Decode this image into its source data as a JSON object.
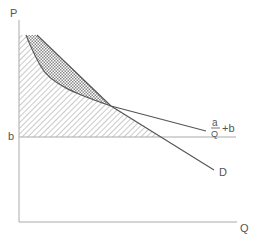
{
  "diagram": {
    "type": "economics-demand-curve",
    "axes": {
      "y_label": "P",
      "x_label": "Q"
    },
    "levels": {
      "b_label": "b"
    },
    "curves": {
      "hyperbola_label_numerator": "a",
      "hyperbola_label_denominator": "Q",
      "hyperbola_label_suffix": "+b",
      "demand_label": "D"
    },
    "colors": {
      "line": "#555555",
      "axis": "#aaaaaa",
      "hatch": "#999999"
    }
  }
}
